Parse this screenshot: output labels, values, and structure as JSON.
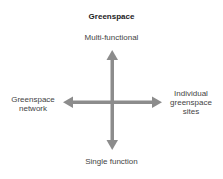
{
  "diagram": {
    "title": "Greenspace",
    "axes": {
      "top": "Multi-functional",
      "bottom": "Single function",
      "left": "Greenspace network",
      "right": "Individual greenspace sites"
    },
    "colors": {
      "arrow": "#8c8c8c",
      "text": "#444444"
    }
  }
}
